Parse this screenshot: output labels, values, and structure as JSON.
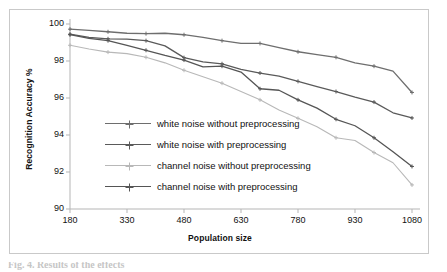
{
  "figure": {
    "caption": "Fig. 4. Results of the effects"
  },
  "chart_data": {
    "type": "line",
    "title": "",
    "xlabel": "Population size",
    "ylabel": "Recognition Accuracy %",
    "xlim": [
      180,
      1080
    ],
    "ylim": [
      90,
      100
    ],
    "xticks": [
      180,
      330,
      480,
      630,
      780,
      930,
      1080
    ],
    "yticks": [
      90,
      92,
      94,
      96,
      98,
      100
    ],
    "grid": false,
    "legend_position": "inside-left-center",
    "x": [
      180,
      230,
      280,
      330,
      380,
      430,
      480,
      530,
      580,
      630,
      680,
      730,
      780,
      830,
      880,
      930,
      980,
      1030,
      1080
    ],
    "series": [
      {
        "name": "white noise without preprocessing",
        "color": "#6e6e6e",
        "marker": "cross",
        "values": [
          99.72,
          99.66,
          99.58,
          99.5,
          99.48,
          99.5,
          99.42,
          99.28,
          99.1,
          98.95,
          98.95,
          98.72,
          98.5,
          98.35,
          98.2,
          97.9,
          97.72,
          97.45,
          96.3
        ]
      },
      {
        "name": "white noise with preprocessing",
        "color": "#5a5a5a",
        "marker": "cross",
        "values": [
          99.45,
          99.28,
          99.2,
          99.18,
          99.1,
          98.82,
          98.18,
          97.95,
          97.85,
          97.55,
          97.35,
          97.18,
          96.9,
          96.62,
          96.35,
          96.05,
          95.78,
          95.2,
          94.92
        ]
      },
      {
        "name": "channel noise without preprocessing",
        "color": "#b8b8b8",
        "marker": "cross",
        "values": [
          98.85,
          98.65,
          98.48,
          98.4,
          98.2,
          97.9,
          97.5,
          97.15,
          96.8,
          96.35,
          95.9,
          95.35,
          94.9,
          94.45,
          93.85,
          93.7,
          93.05,
          92.5,
          91.3
        ]
      },
      {
        "name": "channel noise with preprocessing",
        "color": "#555555",
        "marker": "cross",
        "values": [
          99.42,
          99.22,
          99.1,
          98.85,
          98.58,
          98.3,
          98.05,
          97.68,
          97.72,
          97.4,
          96.5,
          96.42,
          95.9,
          95.45,
          94.85,
          94.5,
          93.85,
          93.1,
          92.3
        ]
      }
    ]
  },
  "legend": {
    "items": [
      {
        "label": "white noise without preprocessing",
        "color": "#6e6e6e"
      },
      {
        "label": "white noise with preprocessing",
        "color": "#5a5a5a"
      },
      {
        "label": "channel noise without preprocessing",
        "color": "#b8b8b8"
      },
      {
        "label": "channel noise with preprocessing",
        "color": "#555555"
      }
    ]
  }
}
